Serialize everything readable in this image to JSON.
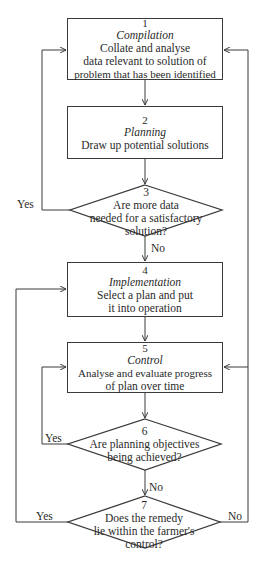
{
  "flowchart": {
    "steps": [
      {
        "num": "1",
        "title": "Compilation",
        "lines": [
          "Collate and analyse",
          "data relevant to solution of",
          "problem that has been identified"
        ]
      },
      {
        "num": "2",
        "title": "Planning",
        "lines": [
          "Draw up potential solutions"
        ]
      },
      {
        "num": "3",
        "question": [
          "Are more data",
          "needed for a satisfactory",
          "solution?"
        ]
      },
      {
        "num": "4",
        "title": "Implementation",
        "lines": [
          "Select a plan and put",
          "it into operation"
        ]
      },
      {
        "num": "5",
        "title": "Control",
        "lines": [
          "Analyse and evaluate progress",
          "of plan over time"
        ]
      },
      {
        "num": "6",
        "question": [
          "Are planning objectives",
          "being achieved?"
        ]
      },
      {
        "num": "7",
        "question": [
          "Does the remedy",
          "lie within the farmer's",
          "control?"
        ]
      }
    ],
    "edge_labels": {
      "d3_yes": "Yes",
      "d3_no": "No",
      "d6_yes": "Yes",
      "d6_no": "No",
      "d7_yes": "Yes",
      "d7_no": "No"
    },
    "line_color": "#3a3a3a"
  }
}
